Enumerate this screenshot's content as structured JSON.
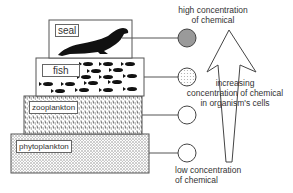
{
  "diagram": {
    "levels": [
      {
        "name": "seal",
        "concentration": "high"
      },
      {
        "name": "fish",
        "concentration": "medium-high"
      },
      {
        "name": "zooplankton",
        "concentration": "medium-low"
      },
      {
        "name": "phytoplankton",
        "concentration": "low"
      }
    ],
    "labels": {
      "seal": "seal",
      "fish": "fish",
      "zooplankton": "zooplankton",
      "phytoplankton": "phytoplankton",
      "high_line1": "high concentration",
      "high_line2": "of chemical",
      "low_line1": "low concentration",
      "low_line2": "of chemical",
      "arrow_line1": "increasing",
      "arrow_line2": "concentration of chemical",
      "arrow_line3": "in organism's cells"
    },
    "colors": {
      "circle_high": "#9a9a9a",
      "circle_medium": "#c4c4c4",
      "circle_low": "#ffffff",
      "outline": "#555555"
    }
  }
}
